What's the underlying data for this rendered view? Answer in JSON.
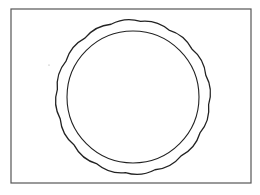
{
  "figure": {
    "frame": {
      "x": 11,
      "y": 9,
      "width": 240,
      "height": 174,
      "stroke": "#555555"
    },
    "scalloped_circle": {
      "cx": 133,
      "cy": 97,
      "radius": 76,
      "lobes": 16,
      "lobe_depth": 3,
      "stroke": "#222222"
    },
    "inner_circle": {
      "cx": 133,
      "cy": 97,
      "r": 66,
      "stroke": "#222222"
    },
    "speck": {
      "cx": 49,
      "cy": 65,
      "r": 0.6,
      "fill": "#999999"
    }
  }
}
